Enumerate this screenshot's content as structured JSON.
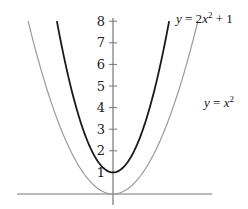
{
  "chart_data": {
    "type": "line",
    "title": "",
    "xlabel": "",
    "ylabel": "",
    "ylim": [
      0,
      8
    ],
    "xlim": [
      -3.2,
      3.3
    ],
    "grid": false,
    "y_ticks": [
      1,
      2,
      3,
      4,
      5,
      6,
      7,
      8
    ],
    "y_tick_labels": [
      "1",
      "2",
      "3",
      "4",
      "5",
      "6",
      "7",
      "8"
    ],
    "series": [
      {
        "name": "y = 2x^2 + 1",
        "label_parts": {
          "lhs": "y",
          "eq": " = 2",
          "var": "x",
          "exp": "2",
          "rest": " + 1"
        },
        "formula": {
          "a": 2,
          "c": 1
        },
        "color": "#1a1a1a",
        "x": [
          -1.87,
          -1.5,
          -1.0,
          -0.5,
          0,
          0.5,
          1.0,
          1.5,
          1.87
        ],
        "values": [
          8.0,
          5.5,
          3.0,
          1.5,
          1.0,
          1.5,
          3.0,
          5.5,
          8.0
        ]
      },
      {
        "name": "y = x^2",
        "label_parts": {
          "lhs": "y",
          "eq": " = ",
          "var": "x",
          "exp": "2",
          "rest": ""
        },
        "formula": {
          "a": 1,
          "c": 0
        },
        "color": "#9a9a9a",
        "x": [
          -2.83,
          -2,
          -1,
          0,
          1,
          2,
          2.83
        ],
        "values": [
          8.0,
          4.0,
          1.0,
          0.0,
          1.0,
          4.0,
          8.0
        ]
      }
    ],
    "annotations": [
      {
        "text": "y = 2x^2 + 1",
        "position": "top-right of dark curve"
      },
      {
        "text": "y = x^2",
        "position": "right of light curve, near y=4.5"
      },
      {
        "text": "1",
        "position": "y-intercept label left of axis"
      }
    ]
  },
  "layout": {
    "origin_px": [
      113,
      194
    ],
    "x_scale_px": 30,
    "y_scale_px": 21.6,
    "x_axis": {
      "x1": 17,
      "x2": 212
    },
    "y_axis": {
      "y1": 18,
      "y2": 205
    },
    "axis_color": "#777777"
  }
}
